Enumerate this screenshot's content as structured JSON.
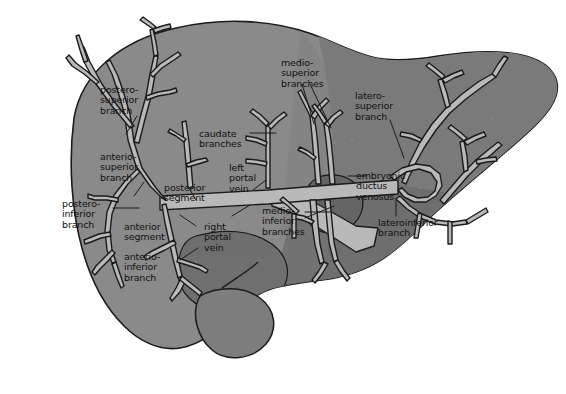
{
  "figure": {
    "view": "anterior schematic"
  },
  "colors": {
    "liver_fill": "#8a8a8a",
    "liver_fill_dark": "#6f6f6f",
    "liver_fill_darker": "#636363",
    "vessel_fill": "#b9b9b9",
    "vessel_stroke": "#1b1b1b",
    "outline": "#1b1b1b",
    "label_text": "#111111",
    "background": "#ffffff",
    "gallbladder_fill": "#7d7d7d"
  },
  "labels": [
    {
      "id": "postero-superior-branch",
      "text": "postero-\nsuperior\nbranch",
      "x": 100,
      "y": 85,
      "align": "left"
    },
    {
      "id": "anterio-superior-branch",
      "text": "anterio-\nsuperior\nbranch",
      "x": 100,
      "y": 152,
      "align": "left"
    },
    {
      "id": "postero-inferior-branch",
      "text": "postero-\ninferior\nbranch",
      "x": 62,
      "y": 199,
      "align": "left"
    },
    {
      "id": "anterior-segment",
      "text": "anterior\nsegment",
      "x": 124,
      "y": 222,
      "align": "left"
    },
    {
      "id": "anterio-inferior-branch",
      "text": "anterio-\ninferior\nbranch",
      "x": 124,
      "y": 252,
      "align": "left"
    },
    {
      "id": "posterior-segment",
      "text": "posterior\nsegment",
      "x": 164,
      "y": 183,
      "align": "left"
    },
    {
      "id": "caudate-branches",
      "text": "caudate\nbranches",
      "x": 199,
      "y": 129,
      "align": "left"
    },
    {
      "id": "left-portal-vein",
      "text": "left\nportal\nvein",
      "x": 229,
      "y": 163,
      "align": "left"
    },
    {
      "id": "right-portal-vein",
      "text": "right\nportal\nvein",
      "x": 204,
      "y": 222,
      "align": "left"
    },
    {
      "id": "medio-superior-branches",
      "text": "medio-\nsuperior\nbranches",
      "x": 281,
      "y": 58,
      "align": "left"
    },
    {
      "id": "medio-inferior-branches",
      "text": "medio-\ninferior\nbranches",
      "x": 262,
      "y": 206,
      "align": "left"
    },
    {
      "id": "latero-superior-branch",
      "text": "latero-\nsuperior\nbranch",
      "x": 355,
      "y": 91,
      "align": "left"
    },
    {
      "id": "embryonic-ductus-venosus",
      "text": "embryonic\nductus\nvenosus",
      "x": 356,
      "y": 171,
      "align": "left"
    },
    {
      "id": "lateroinferior-branch",
      "text": "lateroinferior\nbranch",
      "x": 378,
      "y": 218,
      "align": "left"
    }
  ],
  "structures": [
    {
      "id": "liver-outline",
      "name": "liver silhouette"
    },
    {
      "id": "portal-vein-trunk",
      "name": "portal vein trunk"
    },
    {
      "id": "right-portal-vein",
      "name": "right portal vein"
    },
    {
      "id": "left-portal-vein",
      "name": "left portal vein"
    },
    {
      "id": "anterior-segment",
      "name": "anterior segment territory"
    },
    {
      "id": "posterior-segment",
      "name": "posterior segment territory"
    },
    {
      "id": "caudate-lobe",
      "name": "caudate lobe"
    },
    {
      "id": "gallbladder",
      "name": "gallbladder"
    }
  ],
  "caption": {
    "text": ""
  }
}
